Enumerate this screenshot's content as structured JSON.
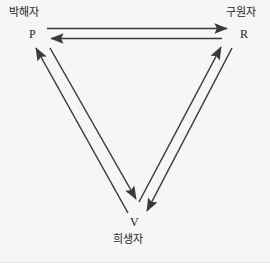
{
  "diagram": {
    "background_color": "#f6f6f6",
    "line_color": "#3a3a3a",
    "text_color": "#262626",
    "nodes": [
      {
        "id": "P",
        "code": "P",
        "name": "박해자",
        "position": "top-left",
        "x": 47,
        "y": 40
      },
      {
        "id": "R",
        "code": "R",
        "name": "구원자",
        "position": "top-right",
        "x": 229,
        "y": 40
      },
      {
        "id": "V",
        "code": "V",
        "name": "희생자",
        "position": "bottom",
        "x": 140,
        "y": 212
      }
    ],
    "edges": [
      {
        "id": "p-to-r",
        "from": "P",
        "to": "R",
        "direction": "right"
      },
      {
        "id": "r-to-p",
        "from": "R",
        "to": "P",
        "direction": "left"
      },
      {
        "id": "p-to-v",
        "from": "P",
        "to": "V",
        "direction": "down-right"
      },
      {
        "id": "v-to-p",
        "from": "V",
        "to": "P",
        "direction": "up-left"
      },
      {
        "id": "r-to-v",
        "from": "R",
        "to": "V",
        "direction": "down-left"
      },
      {
        "id": "v-to-r",
        "from": "V",
        "to": "R",
        "direction": "up-right"
      }
    ]
  }
}
